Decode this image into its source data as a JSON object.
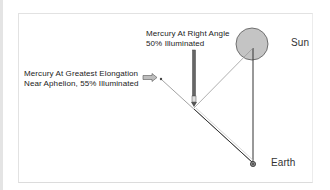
{
  "diagram": {
    "labels": {
      "right_angle_line1": "Mercury At Right Angle",
      "right_angle_line2": "50% Illuminated",
      "elongation_line1": "Mercury At Greatest Elongation",
      "elongation_line2": "Near Aphelion, 55% Illuminated",
      "sun": "Sun",
      "earth": "Earth"
    },
    "colors": {
      "sun_fill": "#c4c4c4",
      "sun_stroke": "#555555",
      "line_dark": "#333333",
      "line_light": "#9a9a9a",
      "arrow_fill": "#bdbdbd"
    }
  }
}
